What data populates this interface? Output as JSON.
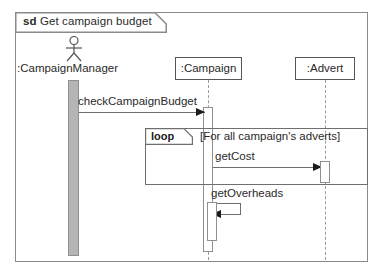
{
  "diagram": {
    "type": "uml-sequence-diagram",
    "frame": {
      "kind": "sd",
      "name": "Get campaign budget"
    },
    "lifelines": [
      {
        "id": "manager",
        "label": ":CampaignManager",
        "shape": "actor"
      },
      {
        "id": "campaign",
        "label": ":Campaign",
        "shape": "box"
      },
      {
        "id": "advert",
        "label": ":Advert",
        "shape": "box"
      }
    ],
    "fragments": [
      {
        "id": "loop-1",
        "operator": "loop",
        "guard": "[For all campaign's adverts]"
      }
    ],
    "messages": [
      {
        "id": "m1",
        "label": "checkCampaignBudget",
        "from": "manager",
        "to": "campaign",
        "kind": "synchronous"
      },
      {
        "id": "m2",
        "label": "getCost",
        "from": "campaign",
        "to": "advert",
        "kind": "synchronous"
      },
      {
        "id": "m3",
        "label": "getOverheads",
        "from": "campaign",
        "to": "campaign",
        "kind": "self-call"
      }
    ],
    "colors": {
      "frame_border": "#8a8a8a",
      "line": "#6f6f6f",
      "text": "#2a2a2a",
      "actor_activation_fill": "#b5b5b5",
      "activation_fill": "#ffffff",
      "lifeline_dash": "#9a9a9a"
    }
  }
}
